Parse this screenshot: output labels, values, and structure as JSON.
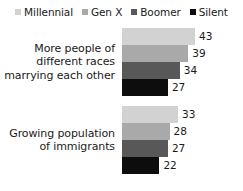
{
  "legend": {
    "items": [
      {
        "label": "Millennial",
        "color": "#d2d2d2"
      },
      {
        "label": "Gen X",
        "color": "#a9a9a9"
      },
      {
        "label": "Boomer",
        "color": "#585858"
      },
      {
        "label": "Silent",
        "color": "#0d0d0d"
      }
    ]
  },
  "chart_data": {
    "type": "bar",
    "orientation": "horizontal",
    "title": "",
    "subtitle": "",
    "xlabel": "",
    "ylabel": "",
    "grid": false,
    "legend_position": "top",
    "xlim": [
      0,
      50
    ],
    "categories": [
      "More people of different races marrying each other",
      "Growing population of immigrants"
    ],
    "category_lines": [
      [
        "More people of",
        "different races",
        "marrying each other"
      ],
      [
        "Growing population",
        "of immigrants"
      ]
    ],
    "series": [
      {
        "name": "Millennial",
        "color": "#d2d2d2",
        "values": [
          43,
          33
        ]
      },
      {
        "name": "Gen X",
        "color": "#a9a9a9",
        "values": [
          39,
          28
        ]
      },
      {
        "name": "Boomer",
        "color": "#585858",
        "values": [
          34,
          27
        ]
      },
      {
        "name": "Silent",
        "color": "#0d0d0d",
        "values": [
          27,
          22
        ]
      }
    ]
  }
}
